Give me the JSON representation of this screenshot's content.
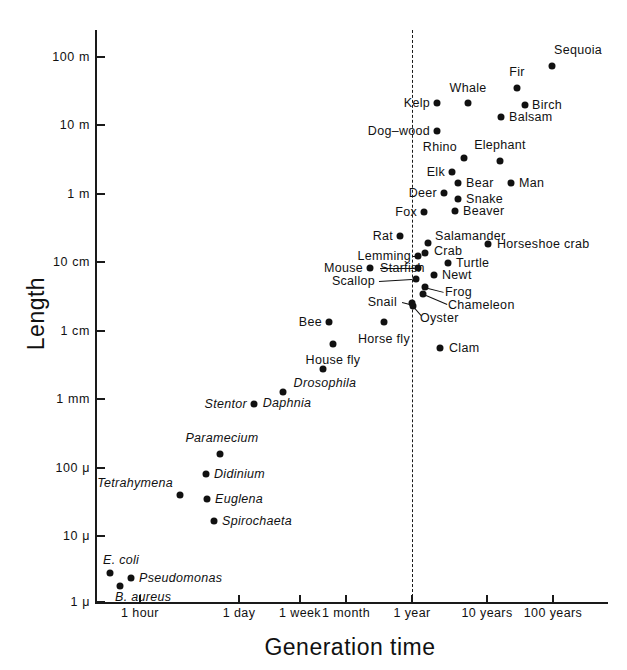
{
  "chart_data": {
    "type": "scatter",
    "title": "",
    "xlabel": "Generation time",
    "ylabel": "Length",
    "xscale": "log",
    "yscale": "log",
    "grid": false,
    "legend": null,
    "annotations": [
      {
        "name": "one-year-reference-line",
        "kind": "vertical-dashed-line",
        "x": "1 year"
      }
    ],
    "xticks": [
      "1 hour",
      "1 day",
      "1 week",
      "1 month",
      "1 year",
      "10 years",
      "100 years"
    ],
    "yticks": [
      "100 m",
      "10 m",
      "1 m",
      "10 cm",
      "1 cm",
      "1 mm",
      "100 μ",
      "10 μ",
      "1 μ"
    ],
    "points": [
      {
        "label": "Sequoia",
        "x": 552,
        "y": 66,
        "lx": 578,
        "ly": 50,
        "anchor": "c",
        "italic": false
      },
      {
        "label": "Fir",
        "x": 517,
        "y": 88,
        "lx": 517,
        "ly": 72,
        "anchor": "c",
        "italic": false
      },
      {
        "label": "Birch",
        "x": 525,
        "y": 105,
        "lx": 532,
        "ly": 105,
        "anchor": "l",
        "italic": false
      },
      {
        "label": "Whale",
        "x": 468,
        "y": 103,
        "lx": 468,
        "ly": 88,
        "anchor": "c",
        "italic": false
      },
      {
        "label": "Balsam",
        "x": 501,
        "y": 117,
        "lx": 509,
        "ly": 117,
        "anchor": "l",
        "italic": false
      },
      {
        "label": "Kelp",
        "x": 437,
        "y": 103,
        "lx": 430,
        "ly": 103,
        "anchor": "r",
        "italic": false
      },
      {
        "label": "Dog–wood",
        "x": 437,
        "y": 131,
        "lx": 430,
        "ly": 131,
        "anchor": "r",
        "italic": false
      },
      {
        "label": "Elephant",
        "x": 500,
        "y": 161,
        "lx": 500,
        "ly": 145,
        "anchor": "c",
        "italic": false
      },
      {
        "label": "Rhino",
        "x": 464,
        "y": 158,
        "lx": 457,
        "ly": 147,
        "anchor": "r",
        "italic": false
      },
      {
        "label": "Elk",
        "x": 452,
        "y": 172,
        "lx": 445,
        "ly": 172,
        "anchor": "r",
        "italic": false
      },
      {
        "label": "Bear",
        "x": 458,
        "y": 183,
        "lx": 466,
        "ly": 183,
        "anchor": "l",
        "italic": false
      },
      {
        "label": "Man",
        "x": 511,
        "y": 183,
        "lx": 519,
        "ly": 183,
        "anchor": "l",
        "italic": false
      },
      {
        "label": "Deer",
        "x": 444,
        "y": 193,
        "lx": 437,
        "ly": 193,
        "anchor": "r",
        "italic": false
      },
      {
        "label": "Snake",
        "x": 458,
        "y": 199,
        "lx": 466,
        "ly": 199,
        "anchor": "l",
        "italic": false
      },
      {
        "label": "Fox",
        "x": 424,
        "y": 212,
        "lx": 417,
        "ly": 212,
        "anchor": "r",
        "italic": false
      },
      {
        "label": "Beaver",
        "x": 455,
        "y": 211,
        "lx": 463,
        "ly": 211,
        "anchor": "l",
        "italic": false
      },
      {
        "label": "Salamander",
        "x": 428,
        "y": 243,
        "lx": 435,
        "ly": 236,
        "anchor": "l",
        "italic": false
      },
      {
        "label": "Rat",
        "x": 400,
        "y": 236,
        "lx": 393,
        "ly": 236,
        "anchor": "r",
        "italic": false
      },
      {
        "label": "Crab",
        "x": 425,
        "y": 253,
        "lx": 434,
        "ly": 251,
        "anchor": "l",
        "italic": false
      },
      {
        "label": "Horseshoe crab",
        "x": 488,
        "y": 244,
        "lx": 497,
        "ly": 244,
        "anchor": "l",
        "italic": false
      },
      {
        "label": "Lemming",
        "x": 418,
        "y": 256,
        "lx": 411,
        "ly": 256,
        "anchor": "r",
        "italic": false
      },
      {
        "label": "Mouse",
        "x": 370,
        "y": 268,
        "lx": 363,
        "ly": 268,
        "anchor": "r",
        "italic": false
      },
      {
        "label": "Starfish",
        "x": 418,
        "y": 268,
        "lx": 380,
        "ly": 268,
        "anchor": "l",
        "italic": false
      },
      {
        "label": "Turtle",
        "x": 448,
        "y": 263,
        "lx": 456,
        "ly": 263,
        "anchor": "l",
        "italic": false
      },
      {
        "label": "Newt",
        "x": 434,
        "y": 275,
        "lx": 442,
        "ly": 275,
        "anchor": "l",
        "italic": false
      },
      {
        "label": "Scallop",
        "x": 416,
        "y": 279,
        "lx": 375,
        "ly": 281,
        "anchor": "r",
        "italic": false
      },
      {
        "label": "Frog",
        "x": 425,
        "y": 287,
        "lx": 445,
        "ly": 292,
        "anchor": "l",
        "italic": false
      },
      {
        "label": "Chameleon",
        "x": 423,
        "y": 294,
        "lx": 448,
        "ly": 305,
        "anchor": "l",
        "italic": false
      },
      {
        "label": "Snail",
        "x": 412,
        "y": 303,
        "lx": 397,
        "ly": 302,
        "anchor": "r",
        "italic": false
      },
      {
        "label": "Oyster",
        "x": 413,
        "y": 306,
        "lx": 420,
        "ly": 318,
        "anchor": "l",
        "italic": false
      },
      {
        "label": "Bee",
        "x": 329,
        "y": 322,
        "lx": 322,
        "ly": 322,
        "anchor": "r",
        "italic": false
      },
      {
        "label": "Horse fly",
        "x": 384,
        "y": 322,
        "lx": 384,
        "ly": 339,
        "anchor": "c",
        "italic": false
      },
      {
        "label": "Clam",
        "x": 440,
        "y": 348,
        "lx": 449,
        "ly": 348,
        "anchor": "l",
        "italic": false
      },
      {
        "label": "House fly",
        "x": 333,
        "y": 344,
        "lx": 333,
        "ly": 360,
        "anchor": "c",
        "italic": false
      },
      {
        "label": "Drosophila",
        "x": 323,
        "y": 369,
        "lx": 325,
        "ly": 383,
        "anchor": "c",
        "italic": true
      },
      {
        "label": "Daphnia",
        "x": 283,
        "y": 392,
        "lx": 287,
        "ly": 403,
        "anchor": "c",
        "italic": true
      },
      {
        "label": "Stentor",
        "x": 254,
        "y": 404,
        "lx": 247,
        "ly": 404,
        "anchor": "r",
        "italic": true
      },
      {
        "label": "Paramecium",
        "x": 220,
        "y": 454,
        "lx": 222,
        "ly": 438,
        "anchor": "c",
        "italic": true
      },
      {
        "label": "Didinium",
        "x": 206,
        "y": 474,
        "lx": 214,
        "ly": 474,
        "anchor": "l",
        "italic": true
      },
      {
        "label": "Tetrahymena",
        "x": 180,
        "y": 495,
        "lx": 173,
        "ly": 483,
        "anchor": "r",
        "italic": true
      },
      {
        "label": "Euglena",
        "x": 207,
        "y": 499,
        "lx": 215,
        "ly": 499,
        "anchor": "l",
        "italic": true
      },
      {
        "label": "Spirochaeta",
        "x": 214,
        "y": 521,
        "lx": 222,
        "ly": 521,
        "anchor": "l",
        "italic": true
      },
      {
        "label": "E. coli",
        "x": 110,
        "y": 573,
        "lx": 103,
        "ly": 560,
        "anchor": "l",
        "italic": true
      },
      {
        "label": "Pseudomonas",
        "x": 131,
        "y": 578,
        "lx": 139,
        "ly": 578,
        "anchor": "l",
        "italic": true
      },
      {
        "label": "B. aureus",
        "x": 120,
        "y": 586,
        "lx": 115,
        "ly": 597,
        "anchor": "l",
        "italic": true
      }
    ],
    "leaders": [
      {
        "name": "starfish-leader",
        "x1": 380,
        "y1": 268,
        "x2": 414,
        "y2": 268
      },
      {
        "name": "scallop-leader",
        "x1": 379,
        "y1": 281,
        "x2": 412,
        "y2": 279
      },
      {
        "name": "lemming-leader",
        "x1": 412,
        "y1": 256,
        "x2": 421,
        "y2": 256
      },
      {
        "name": "frog-leader",
        "x1": 428,
        "y1": 288,
        "x2": 444,
        "y2": 292
      },
      {
        "name": "chameleon-leader",
        "x1": 426,
        "y1": 295,
        "x2": 447,
        "y2": 304
      },
      {
        "name": "oyster-leader",
        "x1": 414,
        "y1": 307,
        "x2": 421,
        "y2": 315
      },
      {
        "name": "snail-leader",
        "x1": 402,
        "y1": 302,
        "x2": 410,
        "y2": 304
      }
    ]
  },
  "axes": {
    "y": {
      "label": "Length",
      "ticks": [
        {
          "text": "100 m",
          "pos": 57
        },
        {
          "text": "10 m",
          "pos": 125
        },
        {
          "text": "1 m",
          "pos": 194
        },
        {
          "text": "10 cm",
          "pos": 262
        },
        {
          "text": "1 cm",
          "pos": 331
        },
        {
          "text": "1 mm",
          "pos": 399
        },
        {
          "text": "100 μ",
          "pos": 468
        },
        {
          "text": "10 μ",
          "pos": 536
        },
        {
          "text": "1 μ",
          "pos": 602
        }
      ]
    },
    "x": {
      "label": "Generation time",
      "ticks": [
        {
          "text": "1 hour",
          "pos": 140
        },
        {
          "text": "1 day",
          "pos": 239
        },
        {
          "text": "1 week",
          "pos": 300
        },
        {
          "text": "1 month",
          "pos": 346
        },
        {
          "text": "1 year",
          "pos": 412
        },
        {
          "text": "10 years",
          "pos": 487
        },
        {
          "text": "100 years",
          "pos": 553
        }
      ]
    }
  }
}
